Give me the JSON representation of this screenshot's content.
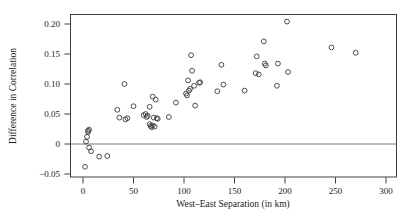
{
  "chart_data": {
    "type": "scatter",
    "title": "",
    "xlabel": "West–East Separation (in km)",
    "ylabel": "Difference in Correlation",
    "xlim": [
      -12,
      312
    ],
    "ylim": [
      -0.065,
      0.218
    ],
    "xticks": [
      0,
      50,
      100,
      150,
      200,
      250,
      300
    ],
    "xtick_labels": [
      "0",
      "50",
      "100",
      "150",
      "200",
      "250",
      "300"
    ],
    "yticks": [
      -0.05,
      0,
      0.05,
      0.1,
      0.15,
      0.2
    ],
    "ytick_labels": [
      "−0.05",
      "0",
      "0.05",
      "0.10",
      "0.15",
      "0.20"
    ],
    "grid": false,
    "legend": null,
    "reference_lines": [
      {
        "axis": "y",
        "value": 0,
        "color": "#6a6a6a"
      }
    ],
    "marker": {
      "shape": "open-circle",
      "radius": 2.4,
      "color": "#3a3a3a",
      "fill": "none"
    },
    "points": [
      {
        "x": 2,
        "y": -0.038
      },
      {
        "x": 3,
        "y": 0.004
      },
      {
        "x": 4,
        "y": 0.012
      },
      {
        "x": 5,
        "y": 0.02
      },
      {
        "x": 6,
        "y": 0.024
      },
      {
        "x": 5,
        "y": 0.022
      },
      {
        "x": 6,
        "y": -0.006
      },
      {
        "x": 8,
        "y": -0.012
      },
      {
        "x": 16,
        "y": -0.021
      },
      {
        "x": 24,
        "y": -0.02
      },
      {
        "x": 34,
        "y": 0.057
      },
      {
        "x": 36,
        "y": 0.044
      },
      {
        "x": 41,
        "y": 0.1
      },
      {
        "x": 42,
        "y": 0.041
      },
      {
        "x": 44,
        "y": 0.043
      },
      {
        "x": 50,
        "y": 0.063
      },
      {
        "x": 60,
        "y": 0.048
      },
      {
        "x": 62,
        "y": 0.05
      },
      {
        "x": 63,
        "y": 0.045
      },
      {
        "x": 64,
        "y": 0.047
      },
      {
        "x": 66,
        "y": 0.062
      },
      {
        "x": 66,
        "y": 0.033
      },
      {
        "x": 67,
        "y": 0.03
      },
      {
        "x": 68,
        "y": 0.028
      },
      {
        "x": 69,
        "y": 0.079
      },
      {
        "x": 69,
        "y": 0.031
      },
      {
        "x": 70,
        "y": 0.044
      },
      {
        "x": 71,
        "y": 0.029
      },
      {
        "x": 72,
        "y": 0.074
      },
      {
        "x": 73,
        "y": 0.043
      },
      {
        "x": 74,
        "y": 0.042
      },
      {
        "x": 85,
        "y": 0.045
      },
      {
        "x": 92,
        "y": 0.069
      },
      {
        "x": 102,
        "y": 0.084
      },
      {
        "x": 103,
        "y": 0.081
      },
      {
        "x": 104,
        "y": 0.106
      },
      {
        "x": 105,
        "y": 0.089
      },
      {
        "x": 106,
        "y": 0.092
      },
      {
        "x": 107,
        "y": 0.148
      },
      {
        "x": 108,
        "y": 0.122
      },
      {
        "x": 110,
        "y": 0.097
      },
      {
        "x": 111,
        "y": 0.064
      },
      {
        "x": 115,
        "y": 0.102
      },
      {
        "x": 116,
        "y": 0.103
      },
      {
        "x": 133,
        "y": 0.088
      },
      {
        "x": 137,
        "y": 0.132
      },
      {
        "x": 139,
        "y": 0.099
      },
      {
        "x": 160,
        "y": 0.089
      },
      {
        "x": 171,
        "y": 0.118
      },
      {
        "x": 172,
        "y": 0.146
      },
      {
        "x": 174,
        "y": 0.116
      },
      {
        "x": 179,
        "y": 0.171
      },
      {
        "x": 180,
        "y": 0.134
      },
      {
        "x": 181,
        "y": 0.131
      },
      {
        "x": 192,
        "y": 0.097
      },
      {
        "x": 193,
        "y": 0.134
      },
      {
        "x": 202,
        "y": 0.204
      },
      {
        "x": 203,
        "y": 0.12
      },
      {
        "x": 246,
        "y": 0.161
      },
      {
        "x": 270,
        "y": 0.152
      }
    ]
  },
  "plot_geometry": {
    "left_px": 83,
    "right_px": 386,
    "x_units_per_px": 0.99,
    "y_zero_px": 144,
    "px_per_005": 30,
    "frame_top_px": 14,
    "frame_bottom_px": 177,
    "frame_left_px": 70,
    "frame_right_px": 397
  }
}
